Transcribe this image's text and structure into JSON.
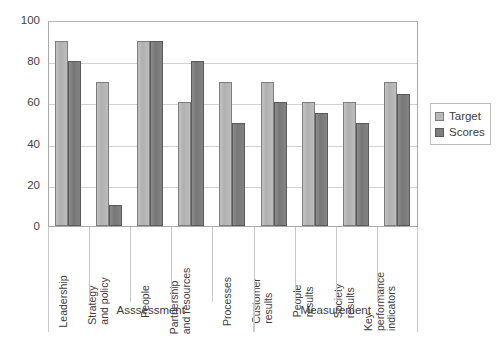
{
  "chart_data": {
    "type": "bar",
    "title": "",
    "xlabel": "",
    "ylabel": "",
    "ylim": [
      0,
      100
    ],
    "ytick_values": [
      100,
      80,
      60,
      40,
      20,
      0
    ],
    "ytick_labels": [
      "100",
      "80",
      "60",
      "40",
      "20",
      "0"
    ],
    "grid": true,
    "legend_position": "right",
    "categories": [
      "Leadership",
      "Strategy and policy",
      "People",
      "Partnership and resources",
      "Processes",
      "Customer results",
      "People results",
      "Society results",
      "Key performance indicators"
    ],
    "category_label_lines": [
      [
        "Leadership"
      ],
      [
        "Strategy",
        "and policy"
      ],
      [
        "People"
      ],
      [
        "Partnership",
        "and resources"
      ],
      [
        "Processes"
      ],
      [
        "Customer",
        "results"
      ],
      [
        "People",
        "results"
      ],
      [
        "Society",
        "results"
      ],
      [
        "Key",
        "performance",
        "indicators"
      ]
    ],
    "series": [
      {
        "name": "Target",
        "color": "#b9b9b9",
        "values": [
          90,
          70,
          90,
          60,
          70,
          70,
          60,
          60,
          70
        ]
      },
      {
        "name": "Scores",
        "color": "#7e7e7e",
        "values": [
          80,
          10,
          90,
          80,
          50,
          60,
          55,
          50,
          64
        ]
      }
    ],
    "groups": [
      {
        "label": "Asssessment",
        "category_start": 0,
        "category_end": 4
      },
      {
        "label": "Measurement",
        "category_start": 5,
        "category_end": 8
      }
    ]
  },
  "legend": {
    "items": [
      {
        "label": "Target"
      },
      {
        "label": "Scores"
      }
    ]
  }
}
